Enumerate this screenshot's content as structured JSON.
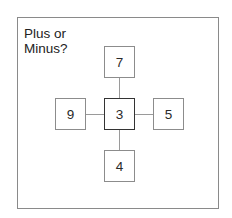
{
  "title": "Plus or\nMinus?",
  "puzzle": {
    "center": "3",
    "top": "7",
    "left": "9",
    "right": "5",
    "bottom": "4"
  },
  "colors": {
    "border": "#8c8c8c",
    "center_border": "#333333",
    "text": "#2a2a2a"
  }
}
